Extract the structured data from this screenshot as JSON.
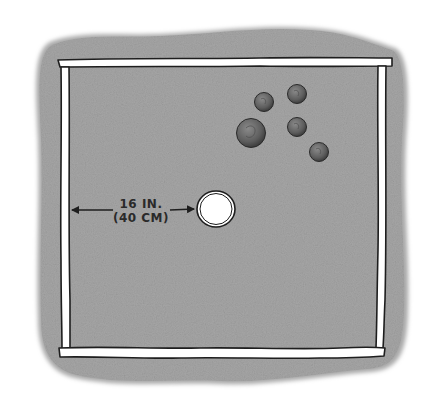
{
  "illustration": {
    "subject": "coin toss board",
    "ground_color": "#a9a9a9",
    "board_color": "#a3a3a3",
    "frame_color": "#ffffff",
    "outline_color": "#1e1e1e",
    "hole_color": "#ffffff",
    "coin_color": "#6d6d6d",
    "coin_count": 5
  },
  "measurement": {
    "imperial": "16 IN.",
    "metric": "(40 CM)",
    "arrow": "double-headed",
    "from": "left frame edge",
    "to": "center hole"
  },
  "coins": [
    {
      "name": "coin-large"
    },
    {
      "name": "coin-1"
    },
    {
      "name": "coin-2"
    },
    {
      "name": "coin-3"
    },
    {
      "name": "coin-4"
    }
  ]
}
